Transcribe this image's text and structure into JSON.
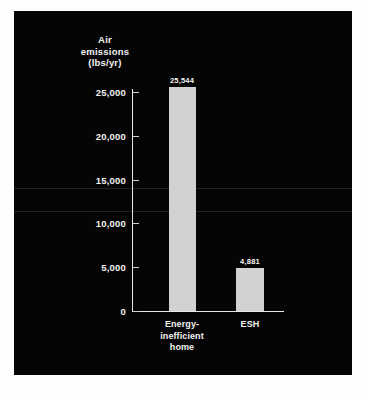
{
  "chart_data": {
    "type": "bar",
    "title": "",
    "xlabel": "",
    "ylabel": "Air emissions (lbs/yr)",
    "ylabel_lines": [
      "Air",
      "emissions",
      "(lbs/yr)"
    ],
    "categories": [
      "Energy-inefficient home",
      "ESH"
    ],
    "category_lines": [
      [
        "Energy-",
        "inefficient",
        "home"
      ],
      [
        "ESH"
      ]
    ],
    "values": [
      25544,
      4881
    ],
    "value_labels": [
      "25,544",
      "4,881"
    ],
    "ylim": [
      0,
      25000
    ],
    "yticks": [
      0,
      5000,
      10000,
      15000,
      20000,
      25000
    ],
    "ytick_labels": [
      "0",
      "5,000",
      "10,000",
      "15,000",
      "20,000",
      "25,000"
    ],
    "grid": false,
    "legend": null,
    "colors": {
      "background": "#050505",
      "page": "#ffffff",
      "bar": "#d2d2d0",
      "axis": "#e8e8e6",
      "text": "#f2f2f0"
    }
  }
}
